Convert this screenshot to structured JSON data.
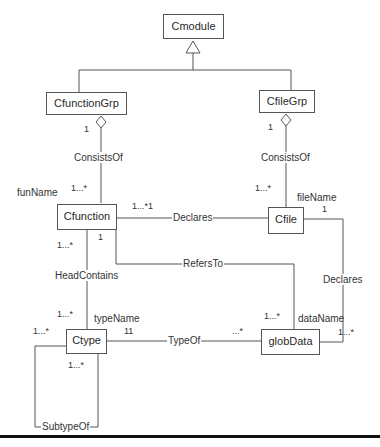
{
  "classes": {
    "cmodule": "Cmodule",
    "cfunctiongrp": "CfunctionGrp",
    "cfilegrp": "CfileGrp",
    "cfunction": "Cfunction",
    "cfile": "Cfile",
    "ctype": "Ctype",
    "globdata": "globData"
  },
  "associations": {
    "consistsof_left": "ConsistsOf",
    "consistsof_right": "ConsistsOf",
    "declares_top": "Declares",
    "refersto": "RefersTo",
    "declares_right": "Declares",
    "headcontains": "HeadContains",
    "typeof": "TypeOf",
    "subtypeof": "SubtypeOf"
  },
  "roles": {
    "funname": "funName",
    "filename": "fileName",
    "typename": "typeName",
    "dataname": "dataName"
  },
  "multiplicities": {
    "cfunctiongrp_agg": "1",
    "cfunction_consists": "1...*",
    "cfilegrp_agg": "1",
    "cfile_consists": "1...*",
    "cfunction_declares": "1...*1",
    "cfile_declares_top": "1",
    "cfunction_head": "1...*",
    "cfunction_refers": "1",
    "ctype_head": "1...*",
    "ctype_typename": "11",
    "globdata_typeof": "...*",
    "globdata_refers": "1...*",
    "globdata_declares": "1...*",
    "ctype_subtype_left": "1...*",
    "ctype_subtype_bottom": "1...*"
  }
}
